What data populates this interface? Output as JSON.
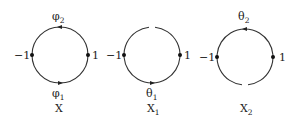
{
  "diagram": {
    "circles": [
      {
        "id": "X",
        "name": "X",
        "name_sub": "",
        "cx": 60,
        "cy": 55,
        "r": 28,
        "gap": "none",
        "top_label": "φ",
        "top_label_sub": "2",
        "bottom_label": "φ",
        "bottom_label_sub": "1",
        "left_label": "−1",
        "right_label": "1"
      },
      {
        "id": "X1",
        "name": "X",
        "name_sub": "1",
        "cx": 152,
        "cy": 55,
        "r": 28,
        "gap": "top",
        "top_label": "",
        "top_label_sub": "",
        "bottom_label": "θ",
        "bottom_label_sub": "1",
        "left_label": "−1",
        "right_label": "1"
      },
      {
        "id": "X2",
        "name": "X",
        "name_sub": "2",
        "cx": 245,
        "cy": 57,
        "r": 28,
        "gap": "bottom",
        "top_label": "θ",
        "top_label_sub": "2",
        "bottom_label": "",
        "bottom_label_sub": "",
        "left_label": "−1",
        "right_label": "1"
      }
    ],
    "colors": {
      "stroke": "#333333",
      "text": "#222222",
      "background": "#ffffff"
    }
  }
}
